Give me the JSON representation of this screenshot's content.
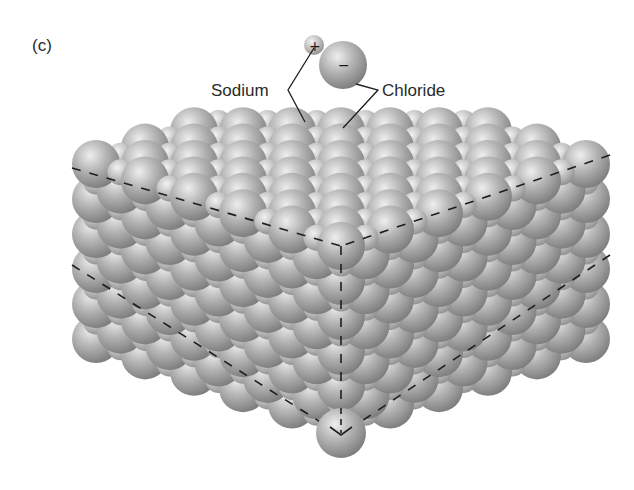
{
  "figure": {
    "panel_label": "(c)",
    "labels": {
      "sodium": "Sodium",
      "chloride": "Chloride"
    },
    "charges": {
      "sodium": "+",
      "chloride": "−"
    },
    "colors": {
      "background": "#ffffff",
      "sphere_light": "#e6e6e6",
      "sphere_mid": "#ababab",
      "sphere_dark": "#6e6e6e",
      "line": "#1e1e1e",
      "text": "#2a2a2a"
    },
    "ion_pair": {
      "sodium": {
        "cx": 314,
        "cy": 45,
        "r": 10
      },
      "chloride": {
        "cx": 343,
        "cy": 65,
        "r": 24
      }
    },
    "chloride_radius": 24,
    "sodium_radius": 13,
    "bottom_ion": {
      "cx": 341,
      "cy": 433,
      "r": 25
    }
  }
}
